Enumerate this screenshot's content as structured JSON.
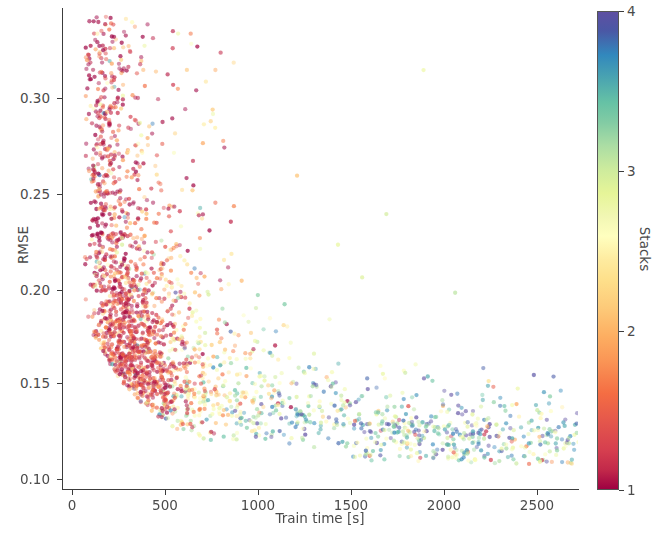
{
  "figure": {
    "background_color": "#ffffff",
    "axis_color": "#3c3c3c",
    "text_color": "#4b4b4b"
  },
  "axes": {
    "ylabel": "RMSE",
    "xlabel": "Train time [s]",
    "ytick_labels": [
      "0.10",
      "0.15",
      "0.20",
      "0.25",
      "0.30"
    ],
    "xtick_labels": [
      "0",
      "500",
      "1000",
      "1500",
      "2000",
      "2500"
    ]
  },
  "colorbar": {
    "label": "Stacks",
    "tick_labels": [
      "1",
      "2",
      "3",
      "4"
    ],
    "colormap": "Spectral",
    "vmin": 1,
    "vmax": 4,
    "stops": [
      "#9e0142",
      "#d53e4f",
      "#f46d43",
      "#fdae61",
      "#fee08b",
      "#ffffbf",
      "#e6f598",
      "#abdda4",
      "#66c2a5",
      "#3288bd",
      "#5e4fa2"
    ]
  },
  "chart_data": {
    "type": "scatter",
    "title": "",
    "xlabel": "Train time [s]",
    "ylabel": "RMSE",
    "xlim": [
      0,
      2770
    ],
    "ylim": [
      0.083,
      0.345
    ],
    "xticks": [
      0,
      500,
      1000,
      1500,
      2000,
      2500
    ],
    "yticks": [
      0.1,
      0.15,
      0.2,
      0.25,
      0.3
    ],
    "grid": false,
    "legend": "none",
    "colorbar": {
      "label": "Stacks",
      "vmin": 1,
      "vmax": 4,
      "ticks": [
        1,
        2,
        3,
        4
      ],
      "cmap": "Spectral"
    },
    "marker": {
      "size": 3.2,
      "alpha": 0.72,
      "shape": "circle"
    },
    "n_points": 1700,
    "color_variable": "Stacks",
    "clusters": [
      {
        "name": "low-time high-RMSE tail",
        "x_range": [
          90,
          600
        ],
        "y_range": [
          0.19,
          0.34
        ],
        "stacks_range": [
          1.0,
          2.2
        ],
        "weight": 0.11
      },
      {
        "name": "dense knee",
        "x_range": [
          150,
          700
        ],
        "y_range": [
          0.135,
          0.195
        ],
        "stacks_range": [
          1.0,
          1.9
        ],
        "weight": 0.34
      },
      {
        "name": "mid band",
        "x_range": [
          600,
          1300
        ],
        "y_range": [
          0.115,
          0.165
        ],
        "stacks_range": [
          1.6,
          3.0
        ],
        "weight": 0.32
      },
      {
        "name": "flat tail",
        "x_range": [
          1200,
          2100
        ],
        "y_range": [
          0.108,
          0.15
        ],
        "stacks_range": [
          2.2,
          3.6
        ],
        "weight": 0.16
      },
      {
        "name": "sparse long runs",
        "x_range": [
          2000,
          2700
        ],
        "y_range": [
          0.105,
          0.155
        ],
        "stacks_range": [
          2.4,
          4.0
        ],
        "weight": 0.07
      }
    ],
    "x_sample": [
      118,
      143,
      152,
      161,
      170,
      178,
      185,
      193,
      201,
      214,
      226,
      238,
      249,
      260,
      272,
      283,
      295,
      308,
      320,
      333,
      345,
      358,
      370,
      383,
      396,
      410,
      423,
      437,
      451,
      466,
      480,
      495,
      510,
      526,
      541,
      557,
      574,
      590,
      607,
      625,
      643,
      661,
      680,
      700,
      720,
      741,
      762,
      784,
      807,
      830,
      854,
      879,
      905,
      931,
      958,
      986,
      1015,
      1045,
      1076,
      1108,
      1141,
      1175,
      1210,
      1246,
      1284,
      1322,
      1362,
      1403,
      1445,
      1489,
      1534,
      1580,
      1628,
      1677,
      1728,
      1780,
      1834,
      1890,
      1947,
      2006,
      2067,
      2130,
      2195,
      2262,
      2331,
      2402,
      2475,
      2551,
      2629,
      2710
    ],
    "y_sample": [
      0.334,
      0.3,
      0.283,
      0.268,
      0.255,
      0.246,
      0.238,
      0.231,
      0.225,
      0.219,
      0.214,
      0.209,
      0.205,
      0.201,
      0.197,
      0.194,
      0.191,
      0.188,
      0.185,
      0.182,
      0.18,
      0.178,
      0.176,
      0.174,
      0.172,
      0.17,
      0.168,
      0.167,
      0.165,
      0.164,
      0.162,
      0.161,
      0.16,
      0.158,
      0.157,
      0.156,
      0.155,
      0.154,
      0.153,
      0.152,
      0.151,
      0.15,
      0.149,
      0.148,
      0.147,
      0.146,
      0.145,
      0.144,
      0.143,
      0.143,
      0.142,
      0.141,
      0.14,
      0.14,
      0.139,
      0.138,
      0.138,
      0.137,
      0.136,
      0.136,
      0.135,
      0.135,
      0.134,
      0.134,
      0.133,
      0.133,
      0.132,
      0.132,
      0.131,
      0.131,
      0.13,
      0.13,
      0.129,
      0.129,
      0.128,
      0.128,
      0.127,
      0.127,
      0.126,
      0.126,
      0.125,
      0.125,
      0.124,
      0.124,
      0.123,
      0.123,
      0.122,
      0.122,
      0.121,
      0.121
    ],
    "stacks_sample": [
      1.0,
      1.0,
      1.1,
      1.0,
      1.1,
      1.2,
      1.0,
      1.1,
      1.2,
      1.1,
      1.2,
      1.3,
      1.2,
      1.3,
      1.2,
      1.4,
      1.3,
      1.4,
      1.5,
      1.4,
      1.5,
      1.6,
      1.5,
      1.6,
      1.7,
      1.6,
      1.7,
      1.8,
      1.7,
      1.9,
      1.8,
      1.9,
      2.0,
      1.9,
      2.1,
      2.0,
      2.1,
      2.2,
      2.1,
      2.3,
      2.2,
      2.3,
      2.4,
      2.3,
      2.5,
      2.4,
      2.5,
      2.6,
      2.5,
      2.7,
      2.6,
      2.7,
      2.8,
      2.7,
      2.9,
      2.8,
      2.9,
      3.0,
      2.9,
      3.1,
      3.0,
      3.1,
      3.2,
      3.1,
      3.2,
      3.3,
      3.2,
      3.3,
      3.4,
      3.3,
      3.4,
      3.5,
      3.4,
      3.5,
      3.4,
      3.6,
      3.5,
      3.6,
      3.5,
      3.7,
      3.6,
      3.7,
      3.6,
      3.8,
      3.7,
      3.8,
      3.7,
      3.9,
      3.8,
      4.0
    ]
  }
}
